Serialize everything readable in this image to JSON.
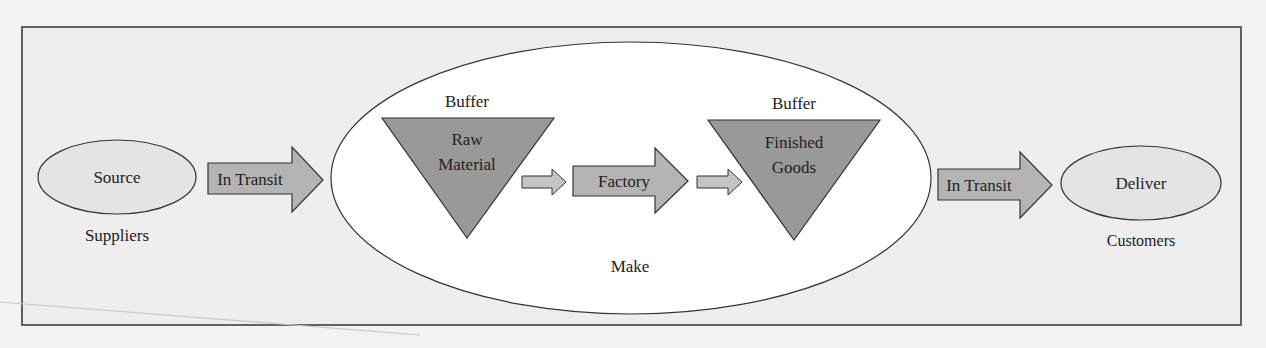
{
  "diagram": {
    "type": "supply-chain-process-map",
    "colors": {
      "page_background": "#f3f3f3",
      "frame_fill": "#eeeeee",
      "frame_stroke": "#333333",
      "make_ellipse_fill": "#ffffff",
      "endpoint_ellipse_fill": "#e4e4e4",
      "buffer_triangle_fill": "#999999",
      "arrow_fill": "#b4b4b4",
      "small_arrow_fill": "#c4c4c4",
      "stroke": "#333333",
      "text": "#222222"
    },
    "nodes": {
      "source": {
        "label": "Source",
        "caption": "Suppliers"
      },
      "transit_in": {
        "label": "In Transit"
      },
      "make": {
        "caption": "Make",
        "raw_buffer": {
          "title": "Buffer",
          "line1": "Raw",
          "line2": "Material"
        },
        "factory": {
          "label": "Factory"
        },
        "finished_buffer": {
          "title": "Buffer",
          "line1": "Finished",
          "line2": "Goods"
        }
      },
      "transit_out": {
        "label": "In Transit"
      },
      "deliver": {
        "label": "Deliver",
        "caption": "Customers"
      }
    },
    "flow": [
      "Source",
      "In Transit",
      "Buffer: Raw Material",
      "Factory",
      "Buffer: Finished Goods",
      "In Transit",
      "Deliver"
    ]
  }
}
